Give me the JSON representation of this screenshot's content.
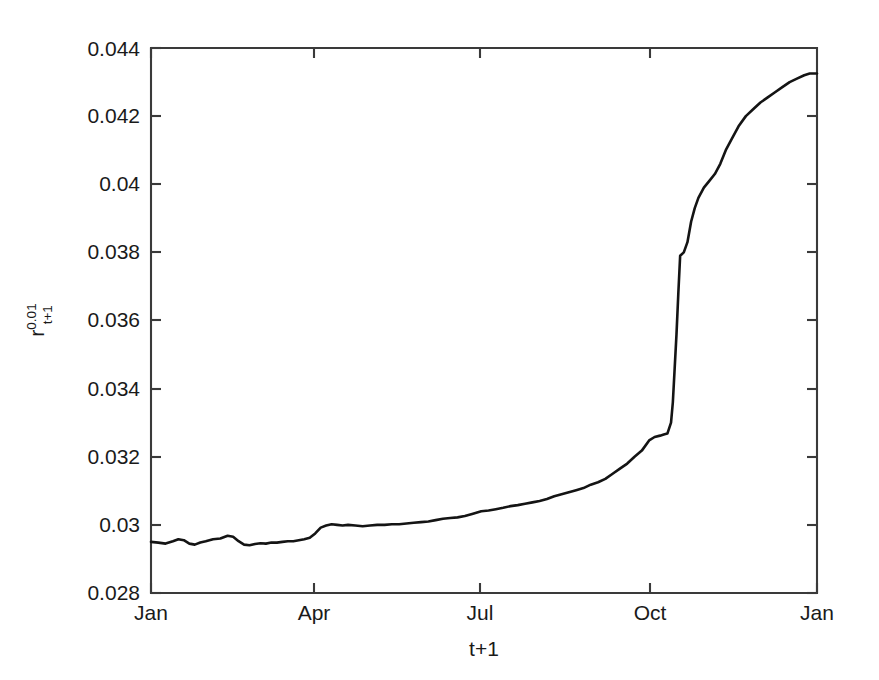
{
  "chart_data": {
    "type": "line",
    "title": "",
    "subtitle": "",
    "xlabel": "t+1",
    "ylabel": "r",
    "ylabel_superscript": "0.01",
    "ylabel_subscript": "t+1",
    "ylabel_full": "r^0.01_t+1",
    "xlim": [
      0,
      365
    ],
    "ylim": [
      0.028,
      0.044
    ],
    "grid": false,
    "legend": null,
    "legend_position": "none",
    "line_color": "#141414",
    "background_color": "#ffffff",
    "axis_color": "#3a3a3a",
    "ytick_labels": [
      "0.028",
      "0.03",
      "0.032",
      "0.034",
      "0.036",
      "0.038",
      "0.04",
      "0.042",
      "0.044"
    ],
    "ytick_values": [
      0.028,
      0.03,
      0.032,
      0.034,
      0.036,
      0.038,
      0.04,
      0.042,
      0.044
    ],
    "xtick_labels": [
      "Jan",
      "Apr",
      "Jul",
      "Oct",
      "Jan"
    ],
    "xtick_values": [
      0,
      90,
      181,
      273,
      365
    ],
    "series": [
      {
        "name": "r_t+1^0.01",
        "x": [
          0,
          4,
          8,
          12,
          15,
          18,
          21,
          24,
          27,
          30,
          34,
          38,
          42,
          45,
          48,
          51,
          54,
          57,
          60,
          63,
          66,
          69,
          72,
          75,
          78,
          81,
          84,
          87,
          90,
          93,
          96,
          99,
          102,
          105,
          108,
          112,
          116,
          120,
          124,
          128,
          132,
          136,
          140,
          144,
          148,
          152,
          156,
          160,
          164,
          168,
          172,
          176,
          181,
          185,
          189,
          193,
          197,
          201,
          205,
          209,
          213,
          217,
          221,
          225,
          229,
          233,
          237,
          241,
          245,
          249,
          253,
          257,
          261,
          265,
          269,
          273,
          276,
          279,
          281,
          283,
          285,
          286,
          287,
          288,
          289,
          290,
          292,
          294,
          296,
          298,
          300,
          303,
          306,
          309,
          312,
          315,
          318,
          322,
          326,
          330,
          334,
          338,
          342,
          346,
          350,
          354,
          358,
          361,
          365
        ],
        "values": [
          0.0295,
          0.02948,
          0.02945,
          0.02952,
          0.02958,
          0.02955,
          0.02945,
          0.02942,
          0.02948,
          0.02952,
          0.02958,
          0.0296,
          0.02968,
          0.02965,
          0.02952,
          0.02942,
          0.0294,
          0.02944,
          0.02946,
          0.02945,
          0.02948,
          0.02948,
          0.0295,
          0.02952,
          0.02952,
          0.02955,
          0.02958,
          0.02962,
          0.02975,
          0.02992,
          0.02998,
          0.03002,
          0.03,
          0.02998,
          0.03,
          0.02998,
          0.02996,
          0.02998,
          0.03,
          0.03,
          0.03002,
          0.03002,
          0.03004,
          0.03006,
          0.03008,
          0.0301,
          0.03014,
          0.03018,
          0.0302,
          0.03022,
          0.03026,
          0.03032,
          0.0304,
          0.03042,
          0.03046,
          0.0305,
          0.03055,
          0.03058,
          0.03062,
          0.03066,
          0.0307,
          0.03076,
          0.03084,
          0.0309,
          0.03096,
          0.03102,
          0.03108,
          0.03118,
          0.03125,
          0.03135,
          0.0315,
          0.03165,
          0.0318,
          0.032,
          0.03218,
          0.03248,
          0.03258,
          0.03262,
          0.03265,
          0.03268,
          0.033,
          0.0336,
          0.0346,
          0.0356,
          0.0368,
          0.0379,
          0.038,
          0.0383,
          0.0389,
          0.0393,
          0.0396,
          0.0399,
          0.0401,
          0.0403,
          0.0406,
          0.041,
          0.0413,
          0.0417,
          0.042,
          0.0422,
          0.0424,
          0.04255,
          0.0427,
          0.04285,
          0.043,
          0.0431,
          0.0432,
          0.04325,
          0.04325
        ]
      }
    ],
    "annotations": []
  }
}
